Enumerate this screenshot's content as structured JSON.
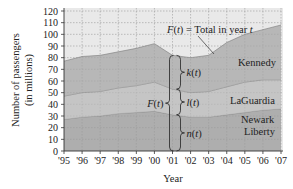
{
  "chart_data": {
    "type": "area",
    "stacked": true,
    "title": "",
    "xlabel": "Year",
    "ylabel": "Number of passengers (in millions)",
    "x": [
      "'95",
      "'96",
      "'97",
      "'98",
      "'99",
      "'00",
      "'01",
      "'02",
      "'03",
      "'04",
      "'05",
      "'06",
      "'07"
    ],
    "xlim": [
      0,
      12
    ],
    "ylim": [
      0,
      120
    ],
    "yticks": [
      0,
      10,
      20,
      30,
      40,
      50,
      60,
      70,
      80,
      90,
      100,
      110,
      120
    ],
    "grid": true,
    "series": [
      {
        "name": "Newark Liberty",
        "function": "n(t)",
        "color": "#9a9a9a",
        "values": [
          27,
          29,
          30,
          32,
          33,
          34,
          31,
          29,
          29,
          31,
          33,
          35,
          36
        ]
      },
      {
        "name": "LaGuardia",
        "function": "l(t)",
        "color": "#b8b8b8",
        "values": [
          20,
          21,
          21,
          22,
          23,
          25,
          22,
          21,
          22,
          24,
          26,
          26,
          25
        ]
      },
      {
        "name": "Kennedy",
        "function": "k(t)",
        "color": "#a5a5a5",
        "values": [
          30,
          31,
          31,
          31,
          32,
          33,
          29,
          30,
          31,
          38,
          41,
          43,
          47
        ]
      }
    ],
    "annotations": {
      "total_label": "F(t) = Total in year t",
      "brace_total": "F(t)",
      "brace_k": "k(t)",
      "brace_l": "l(t)",
      "brace_n": "n(t)",
      "brace_year_index": 6
    },
    "series_labels": {
      "kennedy": "Kennedy",
      "laguardia": "LaGuardia",
      "newark_line1": "Newark",
      "newark_line2": "Liberty"
    },
    "ylabel_line1": "Number of passengers",
    "ylabel_line2": "(in millions)"
  }
}
